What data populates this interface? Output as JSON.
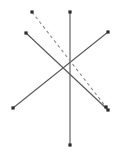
{
  "canvas": {
    "width": 116,
    "height": 154,
    "background_color": "#ffffff"
  },
  "style": {
    "line_color": "#555555",
    "dashed_line_color": "#8a8a8a",
    "marker_color": "#2b2b2b",
    "line_width": 1.1,
    "marker_size": 3.2,
    "dash_pattern": "3 3"
  },
  "diagram": {
    "type": "line-segment-star",
    "segments": [
      {
        "name": "vertical-line",
        "style": "solid",
        "color": "#555555",
        "x1": 70,
        "y1": 12,
        "x2": 70,
        "y2": 145,
        "markers": [
          "start",
          "end"
        ]
      },
      {
        "name": "diagonal-nw-se-line",
        "style": "solid",
        "color": "#555555",
        "x1": 26,
        "y1": 33,
        "x2": 108,
        "y2": 110,
        "markers": [
          "start",
          "end"
        ]
      },
      {
        "name": "diagonal-sw-ne-line",
        "style": "solid",
        "color": "#555555",
        "x1": 13,
        "y1": 108,
        "x2": 108,
        "y2": 32,
        "markers": [
          "start",
          "end"
        ]
      },
      {
        "name": "dashed-line",
        "style": "dashed",
        "color": "#8a8a8a",
        "x1": 32,
        "y1": 12,
        "x2": 106,
        "y2": 107,
        "markers": [
          "start",
          "end"
        ]
      }
    ],
    "endpoint_markers": [
      {
        "name": "marker-vertical-top",
        "x": 70,
        "y": 12
      },
      {
        "name": "marker-vertical-bottom",
        "x": 70,
        "y": 145
      },
      {
        "name": "marker-nw",
        "x": 26,
        "y": 33
      },
      {
        "name": "marker-se",
        "x": 108,
        "y": 110
      },
      {
        "name": "marker-sw",
        "x": 13,
        "y": 108
      },
      {
        "name": "marker-ne",
        "x": 108,
        "y": 32
      },
      {
        "name": "marker-dashed-top",
        "x": 32,
        "y": 12
      },
      {
        "name": "marker-dashed-bottom",
        "x": 106,
        "y": 107
      }
    ],
    "crossing_point": {
      "x": 70,
      "y": 68
    }
  }
}
